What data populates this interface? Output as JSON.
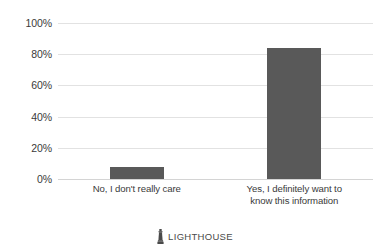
{
  "chart_data": {
    "type": "bar",
    "title": "",
    "subtitle": "",
    "xlabel": "",
    "ylabel": "",
    "categories": [
      "No, I don't really care",
      "Yes, I definitely want to\nknow this information"
    ],
    "values": [
      8,
      84
    ],
    "series": [
      {
        "name": "Response share",
        "values": [
          8,
          84
        ]
      }
    ],
    "ylim": [
      0,
      100
    ],
    "y_ticks": [
      0,
      20,
      40,
      60,
      80,
      100
    ],
    "y_tick_labels": [
      "0%",
      "20%",
      "40%",
      "60%",
      "80%",
      "100%"
    ],
    "value_format": "percent",
    "grid": true,
    "grid_axis": "y",
    "legend": false,
    "legend_position": "none",
    "bar_color": "#595959",
    "gridline_color": "#e2e2e2",
    "axis_line_color": "#d4d4d4",
    "text_color": "#3a3a3a",
    "background_color": "#ffffff"
  },
  "footer": {
    "icon": "lighthouse-icon",
    "brand": "LIGHTHOUSE",
    "brand_color": "#4a4a4a"
  }
}
